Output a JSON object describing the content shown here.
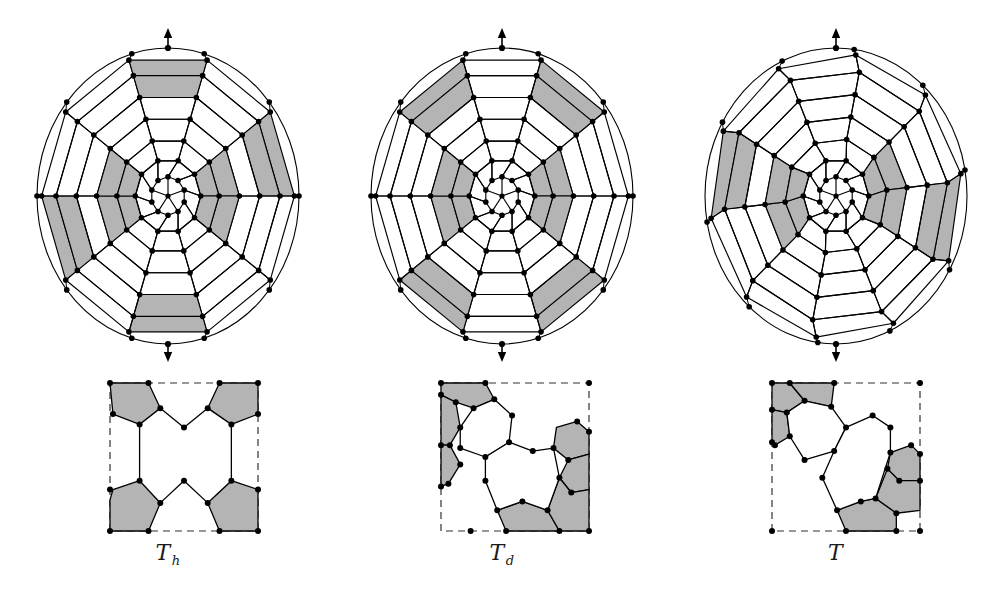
{
  "figure": {
    "background": "#ffffff",
    "ink": "#000000",
    "shade": "#b4b4b4",
    "width": 1002,
    "height": 596
  },
  "panels": [
    {
      "id": "panel-th",
      "caption_symbol": "T",
      "caption_sub": "h",
      "caption_full": "T_h",
      "sphere": {
        "cx": 168,
        "cy": 196,
        "rx": 131,
        "ry": 148,
        "axis_top_label": "up-arrow",
        "axis_bottom_label": "down-arrow"
      },
      "arrows": {
        "top_y": 30,
        "bottom_y": 360
      },
      "rings": [
        {
          "n": 10,
          "r": 1.0,
          "rot": 18,
          "squash": 1.0
        },
        {
          "n": 10,
          "r": 0.86,
          "rot": 0,
          "squash": 1.0
        },
        {
          "n": 10,
          "r": 0.7,
          "rot": 18,
          "squash": 1.0
        },
        {
          "n": 10,
          "r": 0.54,
          "rot": 0,
          "squash": 1.0
        },
        {
          "n": 10,
          "r": 0.38,
          "rot": 18,
          "squash": 1.0
        },
        {
          "n": 10,
          "r": 0.22,
          "rot": 0,
          "squash": 1.0
        }
      ],
      "shaded_sectors": [
        1,
        4,
        6,
        9
      ],
      "inner_shaded": true,
      "vertex_count": 84
    },
    {
      "id": "panel-td",
      "caption_symbol": "T",
      "caption_sub": "d",
      "caption_full": "T_d",
      "sphere": {
        "cx": 502,
        "cy": 196,
        "rx": 131,
        "ry": 148,
        "axis_top_label": "up-arrow",
        "axis_bottom_label": "down-arrow"
      },
      "arrows": {
        "top_y": 30,
        "bottom_y": 360
      },
      "rings": [
        {
          "n": 10,
          "r": 1.0,
          "rot": 18,
          "squash": 1.0
        },
        {
          "n": 10,
          "r": 0.86,
          "rot": 0,
          "squash": 1.0
        },
        {
          "n": 10,
          "r": 0.7,
          "rot": 18,
          "squash": 1.0
        },
        {
          "n": 10,
          "r": 0.54,
          "rot": 0,
          "squash": 1.0
        },
        {
          "n": 10,
          "r": 0.38,
          "rot": 18,
          "squash": 1.0
        },
        {
          "n": 10,
          "r": 0.22,
          "rot": 0,
          "squash": 1.0
        }
      ],
      "shaded_sectors": [
        0,
        3,
        5,
        8
      ],
      "inner_shaded": true,
      "vertex_count": 84
    },
    {
      "id": "panel-t",
      "caption_symbol": "T",
      "caption_sub": "",
      "caption_full": "T",
      "sphere": {
        "cx": 836,
        "cy": 196,
        "rx": 131,
        "ry": 148,
        "axis_top_label": "up-arrow",
        "axis_bottom_label": "down-arrow"
      },
      "arrows": {
        "top_y": 30,
        "bottom_y": 360
      },
      "rings": [
        {
          "n": 10,
          "r": 1.0,
          "rot": 9,
          "squash": 1.0
        },
        {
          "n": 10,
          "r": 0.86,
          "rot": -6,
          "squash": 1.0
        },
        {
          "n": 10,
          "r": 0.7,
          "rot": 12,
          "squash": 1.0
        },
        {
          "n": 10,
          "r": 0.54,
          "rot": -6,
          "squash": 1.0
        },
        {
          "n": 10,
          "r": 0.38,
          "rot": 12,
          "squash": 1.0
        },
        {
          "n": 10,
          "r": 0.22,
          "rot": 0,
          "squash": 1.0
        }
      ],
      "shaded_sectors": [
        2,
        7
      ],
      "inner_shaded": true,
      "vertex_count": 84
    }
  ],
  "fundamental_domains": [
    {
      "id": "domain-th",
      "label": "T_h",
      "box": {
        "x": 110,
        "y": 383,
        "w": 148,
        "h": 148
      },
      "border_style": "dashed-with-solid-segments",
      "solid_edges": [
        "left-upper",
        "left-lower",
        "top-left",
        "top-right",
        "bottom-left",
        "bottom-right",
        "right-upper",
        "right-lower"
      ],
      "faces": [
        {
          "shaded": true,
          "points": [
            [
              0,
              0
            ],
            [
              0.26,
              0
            ],
            [
              0.34,
              0.17
            ],
            [
              0.2,
              0.28
            ],
            [
              0.02,
              0.21
            ]
          ]
        },
        {
          "shaded": true,
          "points": [
            [
              0.74,
              0
            ],
            [
              1,
              0
            ],
            [
              1,
              0.21
            ],
            [
              0.82,
              0.28
            ],
            [
              0.66,
              0.17
            ]
          ]
        },
        {
          "shaded": true,
          "points": [
            [
              0,
              0.79
            ],
            [
              0.02,
              0.72
            ],
            [
              0.2,
              0.66
            ],
            [
              0.34,
              0.81
            ],
            [
              0.26,
              1
            ],
            [
              0,
              1
            ]
          ]
        },
        {
          "shaded": true,
          "points": [
            [
              0.82,
              0.66
            ],
            [
              1,
              0.72
            ],
            [
              1,
              1
            ],
            [
              0.74,
              1
            ],
            [
              0.66,
              0.81
            ]
          ]
        },
        {
          "shaded": false,
          "points": [
            [
              0.34,
              0.17
            ],
            [
              0.5,
              0.3
            ],
            [
              0.66,
              0.17
            ],
            [
              0.82,
              0.28
            ],
            [
              0.82,
              0.66
            ],
            [
              0.66,
              0.81
            ],
            [
              0.5,
              0.66
            ],
            [
              0.34,
              0.81
            ],
            [
              0.2,
              0.66
            ],
            [
              0.2,
              0.28
            ]
          ]
        }
      ],
      "vertices": [
        [
          0,
          0
        ],
        [
          0.26,
          0
        ],
        [
          0.74,
          0
        ],
        [
          1,
          0
        ],
        [
          0.02,
          0.21
        ],
        [
          0.2,
          0.28
        ],
        [
          0.34,
          0.17
        ],
        [
          0.5,
          0.3
        ],
        [
          0.66,
          0.17
        ],
        [
          0.82,
          0.28
        ],
        [
          1,
          0.21
        ],
        [
          0.2,
          0.66
        ],
        [
          0.34,
          0.81
        ],
        [
          0.5,
          0.66
        ],
        [
          0.66,
          0.81
        ],
        [
          0.82,
          0.66
        ],
        [
          0,
          0.72
        ],
        [
          1,
          0.72
        ],
        [
          0,
          1
        ],
        [
          0.26,
          1
        ],
        [
          0.74,
          1
        ],
        [
          1,
          1
        ]
      ]
    },
    {
      "id": "domain-td",
      "label": "T_d",
      "box": {
        "x": 441,
        "y": 383,
        "w": 148,
        "h": 148
      },
      "border_style": "dashed-with-solid-segments",
      "faces": [
        {
          "shaded": true,
          "points": [
            [
              0,
              0
            ],
            [
              0.3,
              0
            ],
            [
              0.36,
              0.11
            ],
            [
              0.22,
              0.17
            ],
            [
              0.1,
              0.13
            ],
            [
              0,
              0.08
            ]
          ]
        },
        {
          "shaded": true,
          "points": [
            [
              0,
              0.08
            ],
            [
              0.1,
              0.13
            ],
            [
              0.13,
              0.3
            ],
            [
              0.06,
              0.42
            ],
            [
              0,
              0.42
            ]
          ]
        },
        {
          "shaded": true,
          "points": [
            [
              0,
              0.42
            ],
            [
              0.06,
              0.42
            ],
            [
              0.13,
              0.55
            ],
            [
              0.05,
              0.68
            ],
            [
              0,
              0.7
            ]
          ]
        },
        {
          "shaded": true,
          "points": [
            [
              0.78,
              0.3
            ],
            [
              0.92,
              0.26
            ],
            [
              1,
              0.33
            ],
            [
              1,
              0.48
            ],
            [
              0.86,
              0.52
            ],
            [
              0.76,
              0.44
            ]
          ]
        },
        {
          "shaded": true,
          "points": [
            [
              0.86,
              0.52
            ],
            [
              1,
              0.48
            ],
            [
              1,
              0.72
            ],
            [
              0.88,
              0.74
            ],
            [
              0.8,
              0.64
            ]
          ]
        },
        {
          "shaded": true,
          "points": [
            [
              0.38,
              0.86
            ],
            [
              0.55,
              0.8
            ],
            [
              0.72,
              0.86
            ],
            [
              0.8,
              1
            ],
            [
              0.44,
              1
            ]
          ]
        },
        {
          "shaded": true,
          "points": [
            [
              0.8,
              0.64
            ],
            [
              0.88,
              0.74
            ],
            [
              1,
              0.72
            ],
            [
              1,
              1
            ],
            [
              0.8,
              1
            ],
            [
              0.72,
              0.86
            ]
          ]
        },
        {
          "shaded": false,
          "points": [
            [
              0.22,
              0.17
            ],
            [
              0.36,
              0.11
            ],
            [
              0.48,
              0.22
            ],
            [
              0.46,
              0.4
            ],
            [
              0.3,
              0.5
            ],
            [
              0.13,
              0.44
            ],
            [
              0.13,
              0.3
            ]
          ]
        },
        {
          "shaded": false,
          "points": [
            [
              0.46,
              0.4
            ],
            [
              0.62,
              0.46
            ],
            [
              0.76,
              0.44
            ],
            [
              0.8,
              0.64
            ],
            [
              0.72,
              0.86
            ],
            [
              0.55,
              0.8
            ],
            [
              0.38,
              0.86
            ],
            [
              0.3,
              0.66
            ],
            [
              0.3,
              0.5
            ]
          ]
        }
      ],
      "vertices": [
        [
          0,
          0
        ],
        [
          0.3,
          0
        ],
        [
          1,
          0
        ],
        [
          0.36,
          0.11
        ],
        [
          0.22,
          0.17
        ],
        [
          0.1,
          0.13
        ],
        [
          0,
          0.08
        ],
        [
          0.13,
          0.3
        ],
        [
          0.48,
          0.22
        ],
        [
          0.92,
          0.26
        ],
        [
          1,
          0.33
        ],
        [
          0.46,
          0.4
        ],
        [
          0,
          0.42
        ],
        [
          0.06,
          0.42
        ],
        [
          0.13,
          0.44
        ],
        [
          0.62,
          0.46
        ],
        [
          0.76,
          0.44
        ],
        [
          0.3,
          0.5
        ],
        [
          0.86,
          0.52
        ],
        [
          0.13,
          0.55
        ],
        [
          0.3,
          0.66
        ],
        [
          0.8,
          0.64
        ],
        [
          0.05,
          0.68
        ],
        [
          0,
          0.7
        ],
        [
          0.88,
          0.74
        ],
        [
          0.55,
          0.8
        ],
        [
          0.38,
          0.86
        ],
        [
          0.72,
          0.86
        ],
        [
          0.2,
          1
        ],
        [
          0.44,
          1
        ],
        [
          0.8,
          1
        ],
        [
          1,
          1
        ]
      ]
    },
    {
      "id": "domain-t",
      "label": "T",
      "box": {
        "x": 772,
        "y": 383,
        "w": 148,
        "h": 148
      },
      "border_style": "dashed-with-solid-segments",
      "faces": [
        {
          "shaded": true,
          "points": [
            [
              0,
              0
            ],
            [
              0.12,
              0
            ],
            [
              0.22,
              0.12
            ],
            [
              0.1,
              0.2
            ],
            [
              0,
              0.18
            ]
          ]
        },
        {
          "shaded": true,
          "points": [
            [
              0.12,
              0
            ],
            [
              0.42,
              0
            ],
            [
              0.4,
              0.16
            ],
            [
              0.22,
              0.12
            ]
          ]
        },
        {
          "shaded": true,
          "points": [
            [
              0,
              0.18
            ],
            [
              0.1,
              0.2
            ],
            [
              0.12,
              0.36
            ],
            [
              0.02,
              0.42
            ],
            [
              0,
              0.4
            ]
          ]
        },
        {
          "shaded": true,
          "points": [
            [
              0.8,
              0.47
            ],
            [
              0.94,
              0.42
            ],
            [
              1,
              0.48
            ],
            [
              1,
              0.66
            ],
            [
              0.86,
              0.66
            ],
            [
              0.78,
              0.58
            ]
          ]
        },
        {
          "shaded": true,
          "points": [
            [
              0.78,
              0.58
            ],
            [
              0.86,
              0.66
            ],
            [
              1,
              0.66
            ],
            [
              1,
              0.86
            ],
            [
              0.84,
              0.88
            ],
            [
              0.7,
              0.78
            ]
          ]
        },
        {
          "shaded": true,
          "points": [
            [
              0.44,
              0.86
            ],
            [
              0.6,
              0.8
            ],
            [
              0.7,
              0.78
            ],
            [
              0.84,
              0.88
            ],
            [
              0.84,
              1
            ],
            [
              0.5,
              1
            ]
          ]
        },
        {
          "shaded": false,
          "points": [
            [
              0.22,
              0.12
            ],
            [
              0.4,
              0.16
            ],
            [
              0.5,
              0.3
            ],
            [
              0.42,
              0.46
            ],
            [
              0.22,
              0.52
            ],
            [
              0.12,
              0.36
            ],
            [
              0.1,
              0.2
            ]
          ]
        },
        {
          "shaded": false,
          "points": [
            [
              0.5,
              0.3
            ],
            [
              0.68,
              0.22
            ],
            [
              0.8,
              0.3
            ],
            [
              0.8,
              0.47
            ],
            [
              0.7,
              0.78
            ],
            [
              0.6,
              0.8
            ],
            [
              0.44,
              0.86
            ],
            [
              0.34,
              0.64
            ],
            [
              0.42,
              0.46
            ]
          ]
        }
      ],
      "vertices": [
        [
          0,
          0
        ],
        [
          0.12,
          0
        ],
        [
          0.42,
          0
        ],
        [
          1,
          0
        ],
        [
          0.22,
          0.12
        ],
        [
          0.4,
          0.16
        ],
        [
          0.1,
          0.2
        ],
        [
          0.68,
          0.22
        ],
        [
          0,
          0.18
        ],
        [
          0.5,
          0.3
        ],
        [
          0.8,
          0.3
        ],
        [
          0.12,
          0.36
        ],
        [
          0,
          0.4
        ],
        [
          0.02,
          0.42
        ],
        [
          0.94,
          0.42
        ],
        [
          0.42,
          0.46
        ],
        [
          0.8,
          0.47
        ],
        [
          1,
          0.48
        ],
        [
          0.22,
          0.52
        ],
        [
          0.78,
          0.58
        ],
        [
          0.34,
          0.64
        ],
        [
          0.86,
          0.66
        ],
        [
          1,
          0.66
        ],
        [
          0.7,
          0.78
        ],
        [
          0.6,
          0.8
        ],
        [
          0.44,
          0.86
        ],
        [
          0.84,
          0.88
        ],
        [
          0,
          1
        ],
        [
          0.5,
          1
        ],
        [
          0.84,
          1
        ],
        [
          1,
          1
        ]
      ]
    }
  ],
  "captions": [
    {
      "symbol": "T",
      "sub": "h",
      "x_center": 168
    },
    {
      "symbol": "T",
      "sub": "d",
      "x_center": 502
    },
    {
      "symbol": "T",
      "sub": "",
      "x_center": 836
    }
  ]
}
